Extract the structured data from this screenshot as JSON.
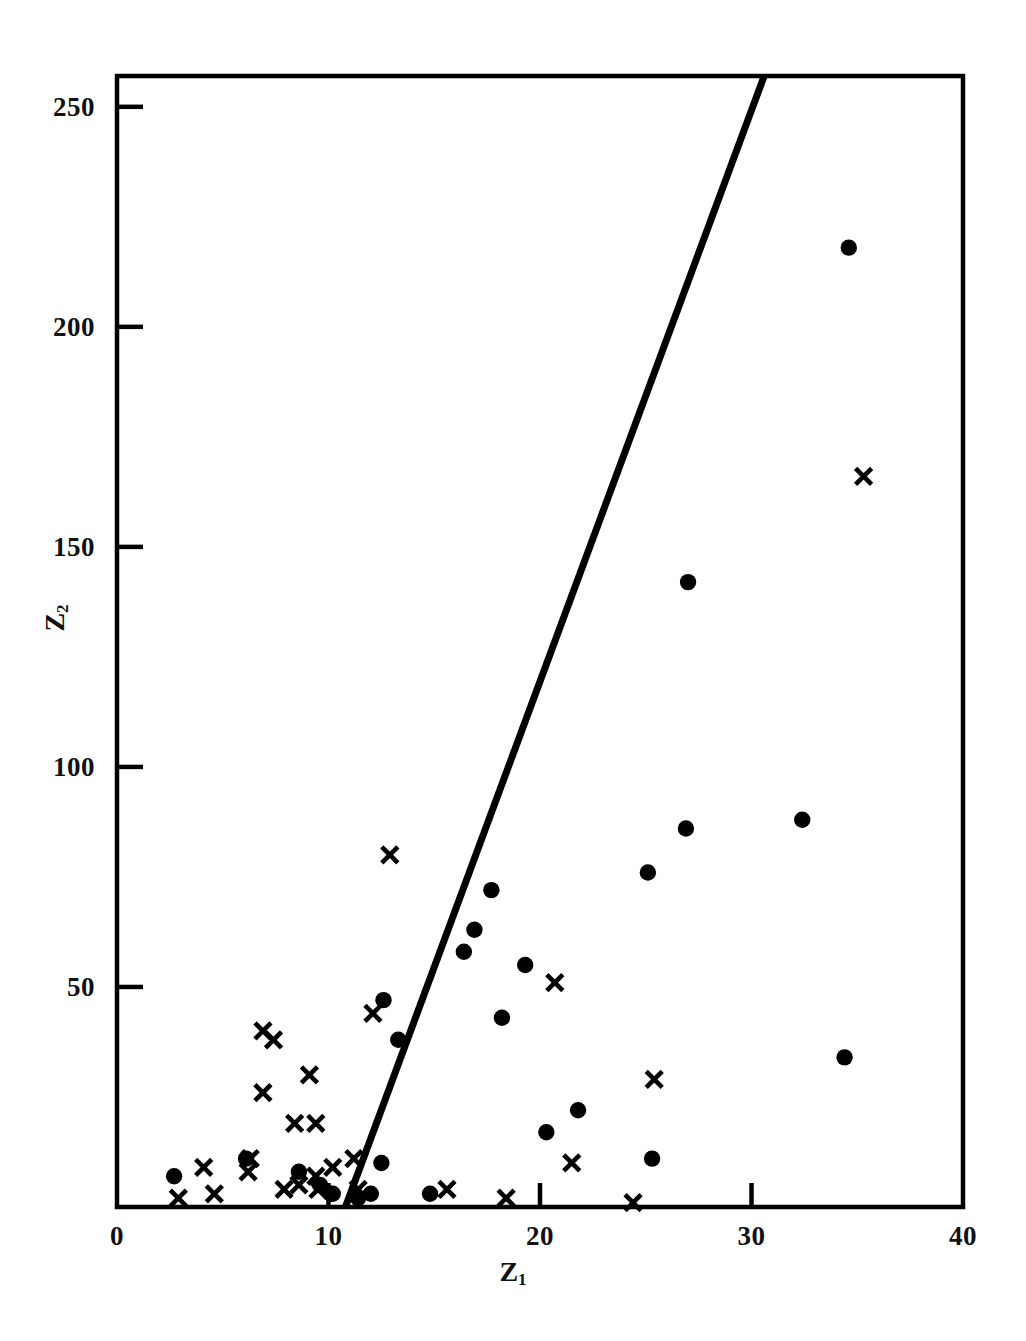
{
  "figure": {
    "background_color": "#ffffff",
    "ink_color": "#000000"
  },
  "axes": {
    "x_title": "Z",
    "x_title_sub": "1",
    "y_title": "Z",
    "y_title_sub": "2",
    "x_ticks": [
      "0",
      "10",
      "20",
      "30",
      "40"
    ],
    "y_ticks": [
      "0",
      "50",
      "100",
      "150",
      "200",
      "250"
    ]
  },
  "chart_data": {
    "type": "scatter",
    "title": "",
    "xlabel": "Z1",
    "ylabel": "Z2",
    "xlim": [
      0,
      40
    ],
    "ylim": [
      0,
      257
    ],
    "xticks": [
      0,
      10,
      20,
      30,
      40
    ],
    "yticks": [
      0,
      50,
      100,
      150,
      200,
      250
    ],
    "grid": false,
    "legend": "none",
    "series": [
      {
        "name": "filled-circle-group",
        "marker": "filled-circle",
        "color": "#000000",
        "points": [
          [
            2.7,
            7
          ],
          [
            6.1,
            11
          ],
          [
            8.6,
            8
          ],
          [
            9.6,
            5
          ],
          [
            10.1,
            3
          ],
          [
            10.2,
            3
          ],
          [
            11.4,
            2
          ],
          [
            12.0,
            3
          ],
          [
            12.6,
            47
          ],
          [
            12.5,
            10
          ],
          [
            13.3,
            38
          ],
          [
            14.8,
            3
          ],
          [
            16.4,
            58
          ],
          [
            16.9,
            63
          ],
          [
            17.7,
            72
          ],
          [
            18.2,
            43
          ],
          [
            19.3,
            55
          ],
          [
            20.3,
            17
          ],
          [
            21.8,
            22
          ],
          [
            25.3,
            11
          ],
          [
            25.1,
            76
          ],
          [
            26.9,
            86
          ],
          [
            27.0,
            142
          ],
          [
            32.4,
            88
          ],
          [
            34.4,
            34
          ],
          [
            34.6,
            218
          ]
        ]
      },
      {
        "name": "cross-group",
        "marker": "x",
        "color": "#000000",
        "points": [
          [
            2.9,
            2
          ],
          [
            4.6,
            3
          ],
          [
            4.1,
            9
          ],
          [
            6.2,
            8
          ],
          [
            6.9,
            40
          ],
          [
            6.9,
            26
          ],
          [
            7.4,
            38
          ],
          [
            6.3,
            11
          ],
          [
            7.9,
            4
          ],
          [
            8.4,
            19
          ],
          [
            9.1,
            30
          ],
          [
            8.6,
            5
          ],
          [
            9.4,
            19
          ],
          [
            9.4,
            7
          ],
          [
            9.5,
            4
          ],
          [
            10.2,
            9
          ],
          [
            11.2,
            11
          ],
          [
            11.4,
            4
          ],
          [
            12.1,
            44
          ],
          [
            12.9,
            80
          ],
          [
            15.6,
            4
          ],
          [
            18.4,
            2
          ],
          [
            20.7,
            51
          ],
          [
            21.5,
            10
          ],
          [
            24.4,
            1
          ],
          [
            25.4,
            29
          ],
          [
            35.3,
            166
          ]
        ]
      }
    ],
    "fitted_line": {
      "name": "boundary-line",
      "style": "solid",
      "color": "#000000",
      "width_px": 7,
      "endpoints": [
        [
          10.8,
          0
        ],
        [
          30.6,
          257
        ]
      ]
    }
  }
}
